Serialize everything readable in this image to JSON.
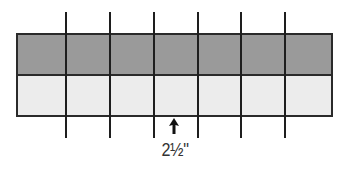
{
  "diagram": {
    "strip_top": {
      "color": "#9a9a9a",
      "label": "dark strip"
    },
    "strip_bottom": {
      "color": "#ececec",
      "label": "light strip"
    },
    "outline_color": "#2a2a2a",
    "cut_line_color": "#1e1e1e",
    "cut_line_x": [
      66,
      110,
      154,
      198,
      241,
      285
    ],
    "segment_count": 7,
    "measurement": {
      "label": "2½\"",
      "indicator": "arrow-up-icon"
    }
  }
}
